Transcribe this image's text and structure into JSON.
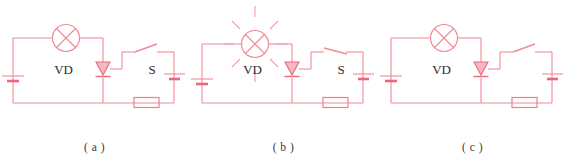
{
  "figure": {
    "type": "circuit-diagram-set",
    "panel_count": 3,
    "line_color": "#f08a95",
    "accent_color": "#e8697c",
    "text_color": "#2b2b2b",
    "background": "#ffffff"
  },
  "panels": [
    {
      "id": "a",
      "caption": "( a )",
      "lamp": {
        "name": "lamp",
        "state": "off",
        "symbol": "circle-with-cross",
        "rays": 0
      },
      "diode": {
        "name": "VD",
        "label": "VD",
        "orientation": "pointing-down"
      },
      "switch": {
        "name": "S",
        "label": "S",
        "state": "open"
      },
      "resistor": {
        "name": "resistor",
        "label": ""
      },
      "battery_left": {
        "name": "battery-left",
        "label": ""
      },
      "battery_right": {
        "name": "battery-right",
        "label": ""
      }
    },
    {
      "id": "b",
      "caption": "( b )",
      "lamp": {
        "name": "lamp",
        "state": "on",
        "symbol": "circle-with-cross",
        "rays": 8
      },
      "diode": {
        "name": "VD",
        "label": "VD",
        "orientation": "pointing-down"
      },
      "switch": {
        "name": "S",
        "label": "S",
        "state": "closed"
      },
      "resistor": {
        "name": "resistor",
        "label": ""
      },
      "battery_left": {
        "name": "battery-left",
        "label": ""
      },
      "battery_right": {
        "name": "battery-right",
        "label": ""
      }
    },
    {
      "id": "c",
      "caption": "( c )",
      "lamp": {
        "name": "lamp",
        "state": "off",
        "symbol": "circle-with-cross",
        "rays": 0
      },
      "diode": {
        "name": "VD",
        "label": "VD",
        "orientation": "pointing-down"
      },
      "switch": {
        "name": "S",
        "label": "",
        "state": "open"
      },
      "resistor": {
        "name": "resistor",
        "label": ""
      },
      "battery_left": {
        "name": "battery-left",
        "label": ""
      },
      "battery_right": {
        "name": "battery-right",
        "label": ""
      }
    }
  ]
}
